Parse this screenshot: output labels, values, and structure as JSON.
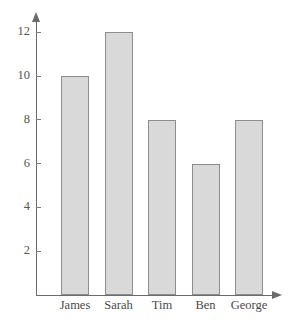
{
  "chart_data": {
    "type": "bar",
    "title": "",
    "subtitle": "",
    "xlabel": "",
    "ylabel": "",
    "categories": [
      "James",
      "Sarah",
      "Tim",
      "Ben",
      "George"
    ],
    "values": [
      10,
      12,
      8,
      6,
      8
    ],
    "ylim": [
      0,
      13
    ],
    "ytick_values": [
      2,
      4,
      6,
      8,
      10,
      12
    ],
    "ytick_labels": [
      "2",
      "4",
      "6",
      "8",
      "10",
      "12"
    ],
    "grid": false,
    "legend": null,
    "legend_position": "none",
    "annotations": [],
    "colors": {
      "bar_fill": "#d9d9d9",
      "bar_stroke": "#8d8d8d",
      "axis": "#6b6b6b",
      "tick_label": "#555555",
      "category_label": "#4a4a4a",
      "background": "#ffffff"
    }
  }
}
